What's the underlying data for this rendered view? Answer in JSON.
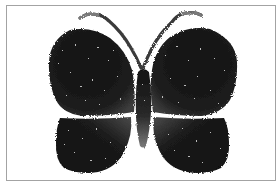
{
  "image": {
    "subject": "butterfly",
    "style": "stippled black-and-white illustration",
    "alt": "Stippled butterfly"
  },
  "colors": {
    "frame_border": "#a3a3a3",
    "background": "#ffffff",
    "wing_dark": "#141414",
    "wing_mid": "#3a3a3a",
    "body": "#1a1a1a",
    "antenna": "#555555",
    "speckle": "#cfcfcf"
  }
}
